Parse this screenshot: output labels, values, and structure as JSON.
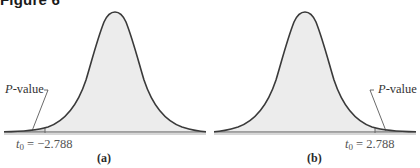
{
  "figure": {
    "title": "Figure 6"
  },
  "panels": [
    {
      "id": "a",
      "label": "(a)",
      "pvalue_label_italic": "P",
      "pvalue_label_rest": "-value",
      "test_stat_symbol": "t",
      "test_stat_subscript": "0",
      "test_stat_equals": " = ",
      "test_stat_value": "−2.788",
      "tail": "left"
    },
    {
      "id": "b",
      "label": "(b)",
      "pvalue_label_italic": "P",
      "pvalue_label_rest": "-value",
      "test_stat_symbol": "t",
      "test_stat_subscript": "0",
      "test_stat_equals": " = ",
      "test_stat_value": "2.788",
      "tail": "right"
    }
  ],
  "colors": {
    "curve": "#3a3a3a",
    "area_fill": "#ececec",
    "tail_fill": "#d4d4d4",
    "axis": "#555555"
  }
}
